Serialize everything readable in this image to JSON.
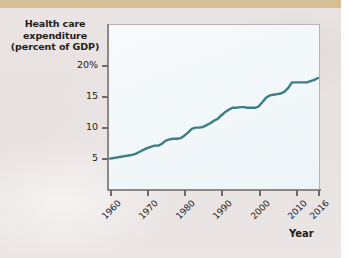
{
  "figure": {
    "background_color": "#e9e4e3",
    "top_band_color": "#d4c093",
    "plot_background_color": "#f5f9fb",
    "line_color": "#3d7d85"
  },
  "chart_data": {
    "type": "line",
    "title": "Health care expenditure (percent of GDP)",
    "title_line1": "Health care",
    "title_line2": "expenditure",
    "title_line3": "(percent of GDP)",
    "xlabel": "Year",
    "ylabel": "Health care expenditure (percent of GDP)",
    "xlim": [
      1960,
      2016
    ],
    "ylim": [
      0,
      20
    ],
    "grid": false,
    "legend": false,
    "x_tick_labels": [
      "1960",
      "1970",
      "1980",
      "1990",
      "2000",
      "2010",
      "2016"
    ],
    "x_tick_values": [
      1960,
      1970,
      1980,
      1990,
      2000,
      2010,
      2016
    ],
    "y_tick_labels": [
      "20%",
      "15",
      "10",
      "5"
    ],
    "y_tick_values": [
      20,
      15,
      10,
      5
    ],
    "series": [
      {
        "name": "Health care expenditure (percent of GDP)",
        "color": "#3d7d85",
        "x": [
          1960,
          1961,
          1962,
          1963,
          1964,
          1965,
          1966,
          1967,
          1968,
          1969,
          1970,
          1971,
          1972,
          1973,
          1974,
          1975,
          1976,
          1977,
          1978,
          1979,
          1980,
          1981,
          1982,
          1983,
          1984,
          1985,
          1986,
          1987,
          1988,
          1989,
          1990,
          1991,
          1992,
          1993,
          1994,
          1995,
          1996,
          1997,
          1998,
          1999,
          2000,
          2001,
          2002,
          2003,
          2004,
          2005,
          2006,
          2007,
          2008,
          2009,
          2010,
          2011,
          2012,
          2013,
          2014,
          2015,
          2016
        ],
        "values": [
          4.9,
          5.0,
          5.1,
          5.2,
          5.3,
          5.4,
          5.5,
          5.7,
          6.0,
          6.3,
          6.6,
          6.8,
          7.0,
          7.0,
          7.3,
          7.8,
          8.0,
          8.1,
          8.1,
          8.2,
          8.6,
          9.1,
          9.7,
          9.9,
          9.9,
          10.0,
          10.3,
          10.6,
          11.0,
          11.3,
          11.9,
          12.4,
          12.8,
          13.1,
          13.1,
          13.2,
          13.2,
          13.1,
          13.1,
          13.1,
          13.3,
          14.0,
          14.7,
          15.1,
          15.2,
          15.3,
          15.4,
          15.7,
          16.3,
          17.2,
          17.2,
          17.2,
          17.2,
          17.2,
          17.4,
          17.6,
          17.9
        ]
      }
    ]
  }
}
